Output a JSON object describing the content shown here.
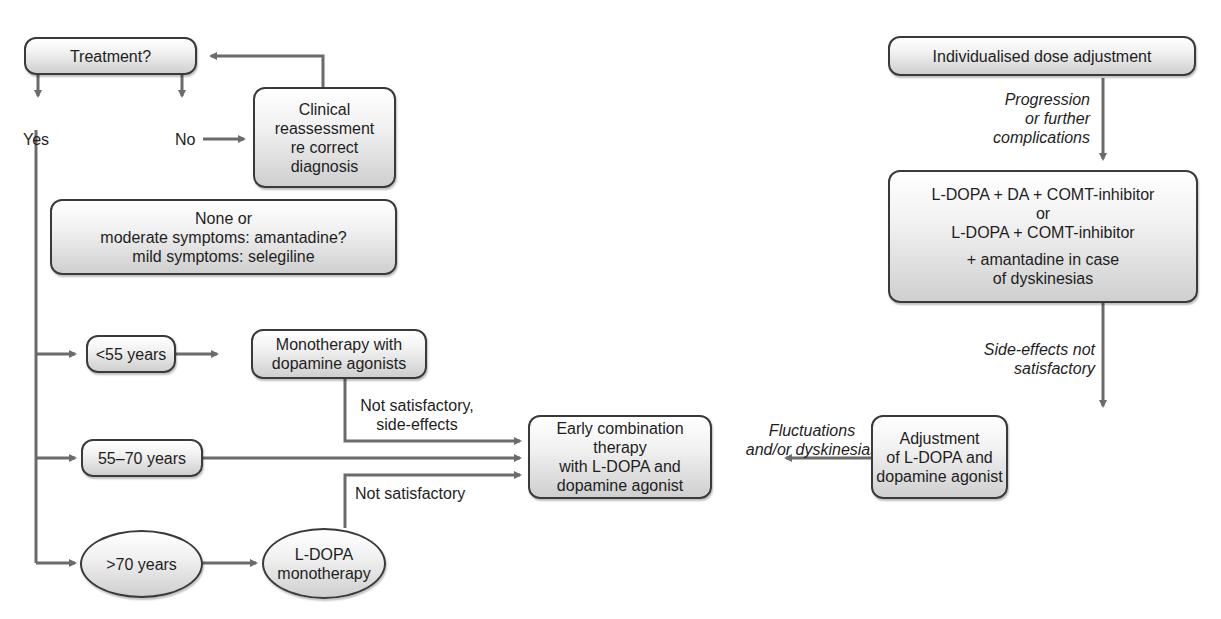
{
  "diagram": {
    "type": "flowchart",
    "title": "",
    "nodes": {
      "treatment": {
        "label": "Treatment?"
      },
      "clinical": {
        "lines": [
          "Clinical",
          "reassessment",
          "re correct",
          "diagnosis"
        ]
      },
      "none_or": {
        "lines": [
          "None or",
          "moderate symptoms: amantadine?",
          "mild symptoms: selegiline"
        ]
      },
      "under55": {
        "label": "<55 years"
      },
      "mono_da": {
        "lines": [
          "Monotherapy with",
          "dopamine agonists"
        ]
      },
      "age55_70": {
        "label": "55–70 years"
      },
      "over70": {
        "label": ">70 years"
      },
      "ldopa_mono": {
        "lines": [
          "L-DOPA",
          "monotherapy"
        ]
      },
      "early_combo": {
        "lines": [
          "Early combination therapy",
          "with L-DOPA and",
          "dopamine agonist"
        ]
      },
      "adjustment": {
        "lines": [
          "Adjustment",
          "of L-DOPA and",
          "dopamine agonist"
        ]
      },
      "comt": {
        "lines": [
          "L-DOPA + DA + COMT-inhibitor",
          "or",
          "L-DOPA + COMT-inhibitor"
        ],
        "lines2": [
          "+ amantadine in case",
          "of dyskinesias"
        ]
      },
      "individualised": {
        "label": "Individualised dose adjustment"
      }
    },
    "labels": {
      "yes": "Yes",
      "no": "No",
      "not_sat_side": [
        "Not satisfactory,",
        "side-effects"
      ],
      "not_sat": "Not satisfactory",
      "fluctuations": [
        "Fluctuations",
        "and/or dyskinesias"
      ],
      "side_effects_not_sat": [
        "Side-effects not",
        "satisfactory"
      ],
      "progression": [
        "Progression",
        "or further",
        "complications"
      ]
    },
    "colors": {
      "line": "#6b6b6b",
      "border": "#3a3a3a",
      "fill_top": "#ffffff",
      "fill_bottom": "#cfcfcf"
    }
  }
}
